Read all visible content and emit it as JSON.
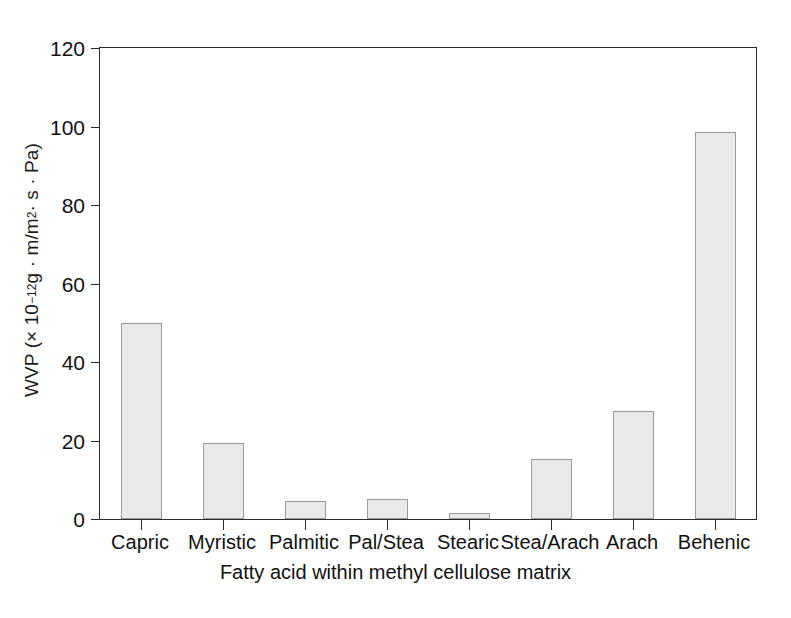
{
  "chart_data": {
    "type": "bar",
    "title": "",
    "subtitle": "",
    "xlabel": "Fatty acid within methyl cellulose matrix",
    "ylabel": "WVP (× 10⁻¹² g · m/m² · s · Pa)",
    "ylabel_parts": {
      "prefix": "WVP (× 10",
      "exponent": "−12",
      "suffix": " g · m/m",
      "exponent2": "2",
      "suffix2": " · s · Pa)"
    },
    "categories": [
      "Capric",
      "Myristic",
      "Palmitic",
      "Pal/Stea",
      "Stearic",
      "Stea/Arach",
      "Arach",
      "Behenic"
    ],
    "values": [
      50.0,
      19.3,
      4.6,
      5.2,
      1.5,
      15.2,
      27.5,
      98.7
    ],
    "ylim": [
      0,
      120
    ],
    "yticks": [
      0,
      20,
      40,
      60,
      80,
      100,
      120
    ],
    "ytick_labels": [
      "0",
      "20",
      "40",
      "60",
      "80",
      "100",
      "120"
    ],
    "grid": false,
    "legend": null,
    "bar_fill_color": "#e9e9e9",
    "bar_edge_color": "#9a9a9a",
    "axis_color": "#2b2b2b",
    "background_color": "#ffffff"
  },
  "figure": {
    "caption_fragment": ""
  }
}
